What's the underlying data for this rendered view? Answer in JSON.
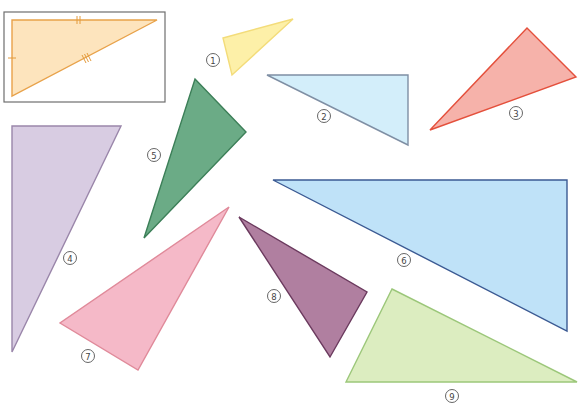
{
  "reference_box": {
    "x": 4,
    "y": 12,
    "width": 161,
    "height": 90,
    "border_color": "#6e6e6e",
    "triangle": {
      "points": [
        [
          12,
          20
        ],
        [
          157,
          20
        ],
        [
          12,
          96
        ]
      ],
      "fill": "#fde4bd",
      "stroke": "#e8a24a",
      "tick_marks": {
        "left_side": "single",
        "top_side": "double",
        "hypotenuse": "triple"
      }
    }
  },
  "triangles": [
    {
      "id": "1",
      "label": "1",
      "points": [
        [
          223,
          38
        ],
        [
          293,
          19
        ],
        [
          232,
          75
        ]
      ],
      "fill": "#fdf0a8",
      "stroke": "#f3dc7a",
      "label_pos": [
        213,
        60
      ]
    },
    {
      "id": "2",
      "label": "2",
      "points": [
        [
          267,
          75
        ],
        [
          408,
          75
        ],
        [
          408,
          145
        ]
      ],
      "fill": "#d3eefa",
      "stroke": "#7f8fa4",
      "label_pos": [
        324,
        116
      ]
    },
    {
      "id": "3",
      "label": "3",
      "points": [
        [
          527,
          28
        ],
        [
          576,
          77
        ],
        [
          430,
          130
        ]
      ],
      "fill": "#f6b2aa",
      "stroke": "#e4503c",
      "label_pos": [
        516,
        113
      ]
    },
    {
      "id": "4",
      "label": "4",
      "points": [
        [
          12,
          126
        ],
        [
          121,
          126
        ],
        [
          12,
          352
        ]
      ],
      "fill": "#d8cce2",
      "stroke": "#9a86aa",
      "label_pos": [
        70,
        258
      ]
    },
    {
      "id": "5",
      "label": "5",
      "points": [
        [
          195,
          79
        ],
        [
          246,
          132
        ],
        [
          144,
          238
        ]
      ],
      "fill": "#6bab86",
      "stroke": "#3c7f58",
      "label_pos": [
        154,
        155
      ]
    },
    {
      "id": "6",
      "label": "6",
      "points": [
        [
          273,
          180
        ],
        [
          567,
          180
        ],
        [
          567,
          331
        ]
      ],
      "fill": "#bfe2f8",
      "stroke": "#3b5a93",
      "label_pos": [
        404,
        260
      ]
    },
    {
      "id": "7",
      "label": "7",
      "points": [
        [
          229,
          207
        ],
        [
          60,
          323
        ],
        [
          138,
          370
        ]
      ],
      "fill": "#f5b9c8",
      "stroke": "#e08a9a",
      "label_pos": [
        88,
        356
      ]
    },
    {
      "id": "8",
      "label": "8",
      "points": [
        [
          239,
          217
        ],
        [
          367,
          292
        ],
        [
          330,
          357
        ]
      ],
      "fill": "#b07fa0",
      "stroke": "#6b3a5e",
      "label_pos": [
        274,
        296
      ]
    },
    {
      "id": "9",
      "label": "9",
      "points": [
        [
          392,
          289
        ],
        [
          577,
          382
        ],
        [
          346,
          382
        ]
      ],
      "fill": "#dcedc0",
      "stroke": "#9cc77a",
      "label_pos": [
        452,
        396
      ]
    }
  ]
}
